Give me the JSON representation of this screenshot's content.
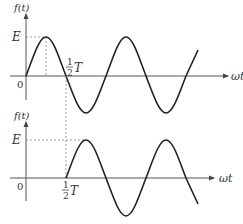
{
  "top_plot": {
    "y_axis_label": "f(t)",
    "x_axis_label": "ωt",
    "amplitude_label": "E",
    "origin_label": "0",
    "half_period_num": "1",
    "half_period_den": "2",
    "half_period_sym": "T",
    "description": "sine wave starting at origin"
  },
  "bottom_plot": {
    "y_axis_label": "f(t)",
    "x_axis_label": "ωt",
    "amplitude_label": "E",
    "origin_label": "0",
    "half_period_num": "1",
    "half_period_den": "2",
    "half_period_sym": "T",
    "description": "sine wave delayed by half period"
  },
  "colors": {
    "curve": "#222222",
    "axis": "#555555",
    "guide": "#888888"
  }
}
